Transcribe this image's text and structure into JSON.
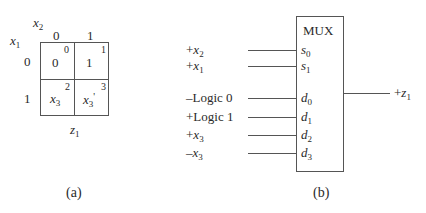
{
  "panel_a": {
    "caption": "(a)",
    "col_var": {
      "base": "x",
      "sub": "2"
    },
    "row_var": {
      "base": "x",
      "sub": "1"
    },
    "col_headers": [
      "0",
      "1"
    ],
    "row_headers": [
      "0",
      "1"
    ],
    "output_label": {
      "base": "z",
      "sub": "1"
    },
    "cells": [
      {
        "index": "0",
        "value_base": "0",
        "value_sub": "",
        "value_suffix": ""
      },
      {
        "index": "1",
        "value_base": "1",
        "value_sub": "",
        "value_suffix": ""
      },
      {
        "index": "2",
        "value_base": "x",
        "value_sub": "3",
        "value_suffix": ""
      },
      {
        "index": "3",
        "value_base": "x",
        "value_sub": "3",
        "value_suffix": "'"
      }
    ]
  },
  "panel_b": {
    "caption": "(b)",
    "block_title": "MUX",
    "inputs": [
      {
        "signal_prefix": "+",
        "signal_base": "x",
        "signal_sub": "2",
        "pin_base": "s",
        "pin_sub": "0"
      },
      {
        "signal_prefix": "+",
        "signal_base": "x",
        "signal_sub": "1",
        "pin_base": "s",
        "pin_sub": "1"
      },
      {
        "signal_prefix": "–",
        "signal_base": "Logic 0",
        "signal_sub": "",
        "pin_base": "d",
        "pin_sub": "0"
      },
      {
        "signal_prefix": "+",
        "signal_base": "Logic 1",
        "signal_sub": "",
        "pin_base": "d",
        "pin_sub": "1"
      },
      {
        "signal_prefix": "+",
        "signal_base": "x",
        "signal_sub": "3",
        "pin_base": "d",
        "pin_sub": "2"
      },
      {
        "signal_prefix": "–",
        "signal_base": "x",
        "signal_sub": "3",
        "pin_base": "d",
        "pin_sub": "3"
      }
    ],
    "output": {
      "prefix": "+",
      "base": "z",
      "sub": "1"
    }
  }
}
